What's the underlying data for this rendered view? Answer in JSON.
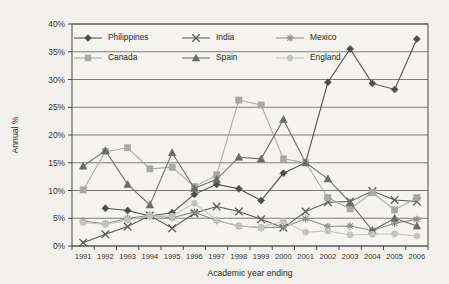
{
  "chart_data": {
    "type": "line",
    "title": "",
    "xlabel": "Academic year ending",
    "ylabel": "Annual %",
    "grid": true,
    "legend_position": "top-inside",
    "x": [
      1991,
      1992,
      1993,
      1994,
      1995,
      1996,
      1997,
      1998,
      1999,
      2000,
      2001,
      2002,
      2003,
      2004,
      2005,
      2006
    ],
    "categories": [
      "1991",
      "1992",
      "1993",
      "1994",
      "1995",
      "1996",
      "1997",
      "1998",
      "1999",
      "2000",
      "2001",
      "2002",
      "2003",
      "2004",
      "2005",
      "2006"
    ],
    "ylim": [
      0,
      40
    ],
    "ytick_labels": [
      "0%",
      "5%",
      "10%",
      "15%",
      "20%",
      "25%",
      "30%",
      "35%",
      "40%"
    ],
    "ytick_values": [
      0,
      5,
      10,
      15,
      20,
      25,
      30,
      35,
      40
    ],
    "series": [
      {
        "name": "Philippines",
        "marker": "diamond",
        "color": "#4d4d4d",
        "values": [
          null,
          6.8,
          6.4,
          5.4,
          6.0,
          9.3,
          11.1,
          10.3,
          8.2,
          13.1,
          15.0,
          29.5,
          35.5,
          29.3,
          28.2,
          37.3
        ]
      },
      {
        "name": "India",
        "marker": "x-cross",
        "color": "#575757",
        "values": [
          0.6,
          2.1,
          3.5,
          5.5,
          3.2,
          5.9,
          7.1,
          6.2,
          4.8,
          3.3,
          6.2,
          7.9,
          8.0,
          9.9,
          8.3,
          8.0
        ]
      },
      {
        "name": "Mexico",
        "marker": "asterisk",
        "color": "#8c8c8c",
        "values": [
          4.5,
          4.0,
          5.0,
          5.5,
          5.1,
          6.1,
          4.6,
          3.6,
          3.3,
          3.4,
          4.9,
          3.5,
          3.6,
          2.8,
          4.1,
          4.8
        ]
      },
      {
        "name": "Canada",
        "marker": "square",
        "color": "#a8a8a5",
        "values": [
          10.1,
          17.0,
          17.7,
          13.9,
          14.2,
          10.7,
          12.8,
          26.3,
          25.4,
          15.7,
          15.0,
          8.7,
          6.7,
          9.6,
          6.5,
          8.7
        ]
      },
      {
        "name": "Spain",
        "marker": "triangle",
        "color": "#6b6b6b",
        "values": [
          14.4,
          17.2,
          11.1,
          7.4,
          16.8,
          10.4,
          12.0,
          16.0,
          15.7,
          22.8,
          15.0,
          12.1,
          7.8,
          2.8,
          5.0,
          3.6
        ]
      },
      {
        "name": "England",
        "marker": "circle",
        "color": "#c2c2be",
        "values": [
          4.2,
          3.9,
          4.7,
          5.4,
          5.4,
          7.7,
          4.7,
          3.6,
          3.4,
          4.5,
          2.5,
          2.7,
          2.0,
          2.1,
          2.2,
          1.8
        ]
      }
    ]
  },
  "legend": {
    "entries": [
      {
        "label": "Philippines"
      },
      {
        "label": "India"
      },
      {
        "label": "Mexico"
      },
      {
        "label": "Canada"
      },
      {
        "label": "Spain"
      },
      {
        "label": "England"
      }
    ]
  },
  "colors": {
    "background": "#f2f1ed",
    "plot_background": "#f5f4f0",
    "axis": "#4a4a48",
    "grid": "#6f6e6b"
  }
}
